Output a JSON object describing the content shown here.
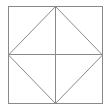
{
  "diagram": {
    "stroke_color": "#8a8a8a",
    "background": "#ffffff",
    "square": {
      "x1": 8,
      "y1": 6,
      "x2": 102,
      "y2": 103
    },
    "midpoints": {
      "top": [
        55,
        6
      ],
      "right": [
        102,
        54.5
      ],
      "bottom": [
        55,
        103
      ],
      "left": [
        8,
        54.5
      ]
    }
  }
}
